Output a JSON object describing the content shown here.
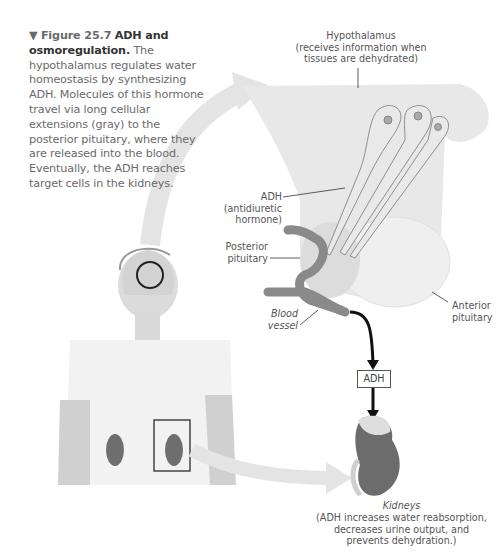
{
  "figure": {
    "marker": "▼",
    "number": "Figure 25.7",
    "title": "ADH and osmoregulation.",
    "body": "The hypothalamus regulates water homeostasis by synthesizing ADH. Molecules of this hormone travel via long cellular extensions (gray) to the posterior pituitary, where they are released into the blood. Eventually, the ADH reaches target cells in the kidneys."
  },
  "labels": {
    "hypothalamus": {
      "line1": "Hypothalamus",
      "line2": "(receives information when",
      "line3": "tissues are dehydrated)"
    },
    "adh": {
      "line1": "ADH",
      "line2": "(antidiuretic",
      "line3": "hormone)"
    },
    "posterior_pituitary": {
      "line1": "Posterior",
      "line2": "pituitary"
    },
    "blood_vessel": {
      "line1": "Blood",
      "line2": "vessel"
    },
    "anterior_pituitary": {
      "line1": "Anterior",
      "line2": "pituitary"
    },
    "adh_box": "ADH",
    "kidneys": {
      "title": "Kidneys",
      "line1": "(ADH increases water reabsorption,",
      "line2": "decreases urine output, and",
      "line3": "prevents dehydration.)"
    }
  },
  "colors": {
    "hypothalamus_fill": "#e6e6e6",
    "anterior_pituitary_fill": "#ececec",
    "vessel": "#8a8a8a",
    "kidney": "#6e6e6e",
    "arrow": "#111111",
    "flow_arrow": "#e2e2e2"
  }
}
